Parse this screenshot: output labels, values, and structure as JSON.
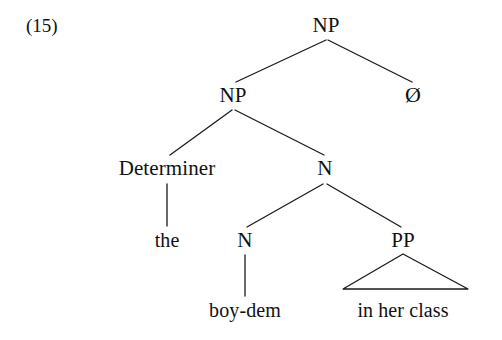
{
  "figure": {
    "example_number": "(15)",
    "kind": "syntax-tree"
  },
  "tree": {
    "nodes": [
      {
        "id": "np-root",
        "label": "NP",
        "type": "category",
        "x": 326,
        "y": 25
      },
      {
        "id": "np-inner",
        "label": "NP",
        "type": "category",
        "x": 233,
        "y": 95
      },
      {
        "id": "null-det",
        "label": "Ø",
        "type": "null",
        "x": 413,
        "y": 95
      },
      {
        "id": "determiner",
        "label": "Determiner",
        "type": "category",
        "x": 167,
        "y": 168
      },
      {
        "id": "n-mid",
        "label": "N",
        "type": "category",
        "x": 325,
        "y": 168
      },
      {
        "id": "the",
        "label": "the",
        "type": "terminal",
        "x": 167,
        "y": 240
      },
      {
        "id": "n-low",
        "label": "N",
        "type": "category",
        "x": 245,
        "y": 240
      },
      {
        "id": "pp",
        "label": "PP",
        "type": "category",
        "x": 403,
        "y": 240
      },
      {
        "id": "boy-dem",
        "label": "boy-dem",
        "type": "terminal",
        "x": 245,
        "y": 310
      },
      {
        "id": "in-her-class",
        "label": "in her class",
        "type": "terminal",
        "x": 403,
        "y": 310
      }
    ],
    "edges": [
      {
        "from": "np-root",
        "to": "np-inner",
        "x1": 326,
        "y1": 40,
        "x2": 236,
        "y2": 82
      },
      {
        "from": "np-root",
        "to": "null-det",
        "x1": 328,
        "y1": 40,
        "x2": 412,
        "y2": 82
      },
      {
        "from": "np-inner",
        "to": "determiner",
        "x1": 232,
        "y1": 110,
        "x2": 170,
        "y2": 155
      },
      {
        "from": "np-inner",
        "to": "n-mid",
        "x1": 235,
        "y1": 110,
        "x2": 324,
        "y2": 155
      },
      {
        "from": "determiner",
        "to": "the",
        "x1": 167,
        "y1": 184,
        "x2": 167,
        "y2": 226
      },
      {
        "from": "n-mid",
        "to": "n-low",
        "x1": 323,
        "y1": 184,
        "x2": 247,
        "y2": 227
      },
      {
        "from": "n-mid",
        "to": "pp",
        "x1": 327,
        "y1": 184,
        "x2": 401,
        "y2": 227
      },
      {
        "from": "n-low",
        "to": "boy-dem",
        "x1": 245,
        "y1": 255,
        "x2": 245,
        "y2": 296
      }
    ],
    "triangles": [
      {
        "node": "pp",
        "covers": "in her class",
        "apex_x": 403,
        "apex_y": 254,
        "base_left_x": 343,
        "base_right_x": 468,
        "base_y": 289
      }
    ],
    "line_color": "#1a1a1a",
    "line_width": 1.3
  }
}
